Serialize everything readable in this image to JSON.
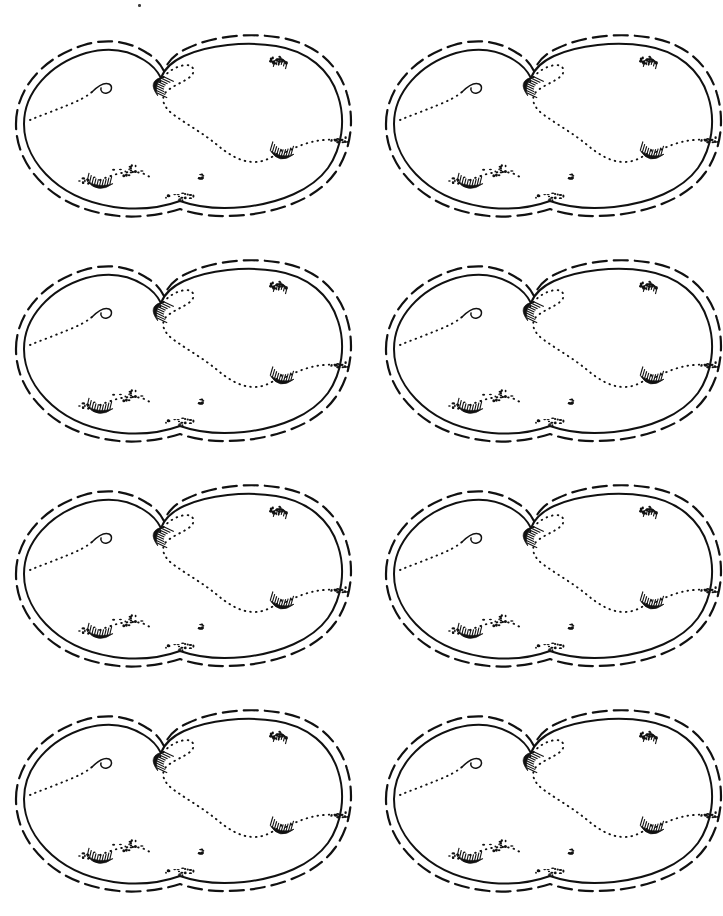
{
  "page": {
    "background_color": "#ffffff",
    "ink_color": "#111111",
    "width_px": 723,
    "height_px": 916,
    "medium": "scanned line-art / pen drawing"
  },
  "grid": {
    "columns": 2,
    "rows": 4,
    "cell_count": 8,
    "column_x": [
      8,
      378
    ],
    "row_y": [
      20,
      245,
      470,
      695
    ],
    "cell_width": 340,
    "cell_height": 205
  },
  "figure": {
    "name": "island-outline-map",
    "repeat_count": 8,
    "elements": [
      {
        "name": "inner-coastline",
        "style": "solid",
        "stroke_width": 2.0,
        "description": "Continuous solid pen line forming a lumpy oval island coastline with a notch at top-center and gentle bumps along the bottom edge."
      },
      {
        "name": "outer-contour",
        "style": "dashed",
        "stroke_width": 2.2,
        "dash_pattern": "14 7",
        "description": "Dashed line running parallel just outside the solid coastline, like an offshore depth contour or border."
      },
      {
        "name": "interior-dotted-trail",
        "style": "dotted",
        "stroke_width": 1.8,
        "dash_pattern": "1 5",
        "description": "Dotted paths meandering across the interior from the top-center notch toward the right side and from the left bay to the center."
      },
      {
        "name": "hatched-crescent-mark",
        "count": 4,
        "description": "Small dark comb-hatched crescents (shaded cliffs or ridges) at the top-center notch, the left-center bay, the right-center interior, and the lower-left bay."
      },
      {
        "name": "stipple-cluster",
        "count": 5,
        "description": "Loose clusters of tiny dots (stipple) near the top-right rim, the bottom-center rim, the lower-left interior, and the right rim."
      },
      {
        "name": "spiral-hook",
        "count": 1,
        "description": "A small curled hook terminating the dotted trail on the upper-left interior."
      },
      {
        "name": "islet-speck",
        "count": 1,
        "description": "An isolated tiny speck near the lower-center of the interior."
      }
    ]
  },
  "artifacts": {
    "name": "scan-speck",
    "description": "A faint stray speck near the top edge of the page, left of center, produced by the scan.",
    "x": 138,
    "y": 4
  }
}
